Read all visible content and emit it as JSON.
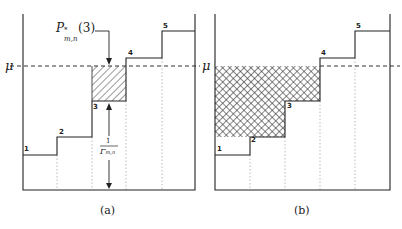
{
  "panels": [
    {
      "id": "a",
      "caption": "(a)",
      "water_level_label": "μ",
      "step_labels": [
        "1",
        "2",
        "3",
        "4",
        "5"
      ],
      "annotation_top": {
        "base": "P",
        "sup": "*",
        "sub": "m,n",
        "arg": "(3)"
      },
      "annotation_height": {
        "numerator": "1",
        "denominator_base": "Γ",
        "denominator_sub": "m,n"
      },
      "fill": "diagonal-hatch over step 3 up to μ"
    },
    {
      "id": "b",
      "caption": "(b)",
      "water_level_label": "μ",
      "step_labels": [
        "1",
        "2",
        "3",
        "4",
        "5"
      ],
      "fill": "cross-hatch over steps 1-3 up to μ"
    }
  ],
  "colors": {
    "line": "#222222",
    "dotted": "#999999",
    "hatch": "#333333"
  }
}
